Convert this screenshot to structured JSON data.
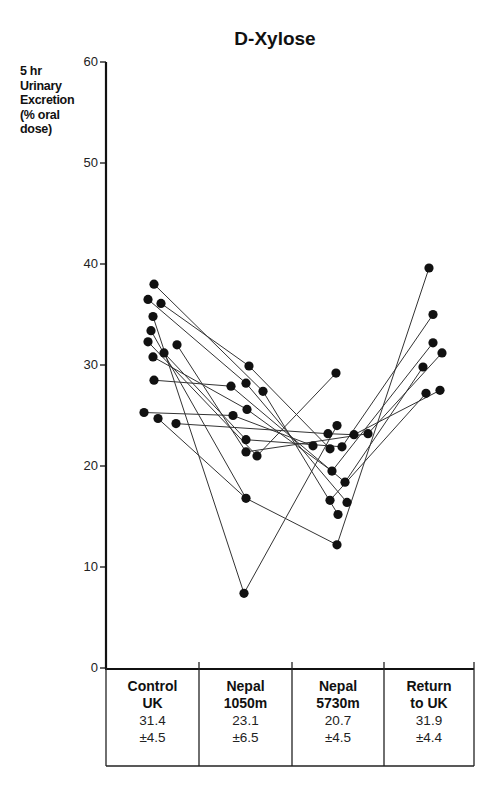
{
  "chart_data": {
    "type": "line",
    "title": "D-Xylose",
    "ylabel": "5 hr Urinary Excretion (% oral dose)",
    "xlabel": "",
    "ylim": [
      0,
      60
    ],
    "yticks": [
      0,
      10,
      20,
      30,
      40,
      50,
      60
    ],
    "grid": false,
    "legend": null,
    "categories": [
      "Control UK",
      "Nepal 1050m",
      "Nepal 5730m",
      "Return to UK"
    ],
    "category_lines": [
      [
        "Control",
        "UK"
      ],
      [
        "Nepal",
        "1050m"
      ],
      [
        "Nepal",
        "5730m"
      ],
      [
        "Return",
        "to UK"
      ]
    ],
    "summary": [
      {
        "category": "Control UK",
        "mean": "31.4",
        "sd": "±4.5"
      },
      {
        "category": "Nepal 1050m",
        "mean": "23.1",
        "sd": "±6.5"
      },
      {
        "category": "Nepal 5730m",
        "mean": "20.7",
        "sd": "±4.5"
      },
      {
        "category": "Return to UK",
        "mean": "31.9",
        "sd": "±4.4"
      }
    ],
    "points": {
      "Control UK": [
        {
          "x": 154,
          "v": 38.0
        },
        {
          "x": 148,
          "v": 36.5
        },
        {
          "x": 161,
          "v": 36.1
        },
        {
          "x": 153,
          "v": 34.8
        },
        {
          "x": 151,
          "v": 33.4
        },
        {
          "x": 148,
          "v": 32.3
        },
        {
          "x": 177,
          "v": 32.0
        },
        {
          "x": 164,
          "v": 31.2
        },
        {
          "x": 153,
          "v": 30.8
        },
        {
          "x": 154,
          "v": 28.5
        },
        {
          "x": 144,
          "v": 25.3
        },
        {
          "x": 158,
          "v": 24.7
        },
        {
          "x": 176,
          "v": 24.2
        }
      ],
      "Nepal 1050m": [
        {
          "x": 249,
          "v": 29.9
        },
        {
          "x": 246,
          "v": 28.2
        },
        {
          "x": 231,
          "v": 27.9
        },
        {
          "x": 263,
          "v": 27.4
        },
        {
          "x": 247,
          "v": 25.6
        },
        {
          "x": 233,
          "v": 25.0
        },
        {
          "x": 246,
          "v": 22.6
        },
        {
          "x": 246,
          "v": 21.4
        },
        {
          "x": 257,
          "v": 21.0
        },
        {
          "x": 246,
          "v": 16.8
        },
        {
          "x": 244,
          "v": 7.4
        }
      ],
      "Nepal 5730m": [
        {
          "x": 336,
          "v": 29.2
        },
        {
          "x": 337,
          "v": 24.0
        },
        {
          "x": 328,
          "v": 23.2
        },
        {
          "x": 354,
          "v": 23.1
        },
        {
          "x": 368,
          "v": 23.2
        },
        {
          "x": 313,
          "v": 22.0
        },
        {
          "x": 330,
          "v": 21.7
        },
        {
          "x": 342,
          "v": 21.9
        },
        {
          "x": 332,
          "v": 19.5
        },
        {
          "x": 345,
          "v": 18.4
        },
        {
          "x": 330,
          "v": 16.6
        },
        {
          "x": 347,
          "v": 16.4
        },
        {
          "x": 338,
          "v": 15.2
        },
        {
          "x": 337,
          "v": 12.2
        }
      ],
      "Return to UK": [
        {
          "x": 429,
          "v": 39.6
        },
        {
          "x": 433,
          "v": 35.0
        },
        {
          "x": 433,
          "v": 32.2
        },
        {
          "x": 442,
          "v": 31.2
        },
        {
          "x": 423,
          "v": 29.8
        },
        {
          "x": 426,
          "v": 27.2
        },
        {
          "x": 440,
          "v": 27.5
        }
      ]
    },
    "segments": [
      [
        [
          154,
          38.0
        ],
        [
          263,
          27.4
        ],
        [
          338,
          15.2
        ]
      ],
      [
        [
          148,
          36.5
        ],
        [
          246,
          28.2
        ],
        [
          347,
          16.4
        ]
      ],
      [
        [
          161,
          36.1
        ],
        [
          249,
          29.9
        ],
        [
          330,
          21.7
        ]
      ],
      [
        [
          153,
          34.8
        ],
        [
          244,
          7.4
        ],
        [
          337,
          24.0
        ]
      ],
      [
        [
          151,
          33.4
        ],
        [
          246,
          16.8
        ],
        [
          337,
          12.2
        ],
        [
          429,
          39.6
        ]
      ],
      [
        [
          148,
          32.3
        ],
        [
          257,
          21.0
        ],
        [
          336,
          29.2
        ]
      ],
      [
        [
          177,
          32.0
        ],
        [
          246,
          21.4
        ],
        [
          368,
          23.2
        ],
        [
          442,
          31.2
        ]
      ],
      [
        [
          164,
          31.2
        ],
        [
          246,
          22.6
        ],
        [
          342,
          21.9
        ],
        [
          433,
          35.0
        ]
      ],
      [
        [
          153,
          30.8
        ],
        [
          247,
          25.6
        ],
        [
          332,
          19.5
        ],
        [
          433,
          32.2
        ]
      ],
      [
        [
          154,
          28.5
        ],
        [
          231,
          27.9
        ],
        [
          345,
          18.4
        ],
        [
          423,
          29.8
        ]
      ],
      [
        [
          144,
          25.3
        ],
        [
          233,
          25.0
        ],
        [
          313,
          22.0
        ]
      ],
      [
        [
          158,
          24.7
        ],
        [
          246,
          16.8
        ]
      ],
      [
        [
          176,
          24.2
        ],
        [
          328,
          23.2
        ],
        [
          354,
          23.1
        ],
        [
          440,
          27.5
        ]
      ],
      [
        [
          330,
          16.6
        ],
        [
          426,
          27.2
        ]
      ]
    ]
  }
}
